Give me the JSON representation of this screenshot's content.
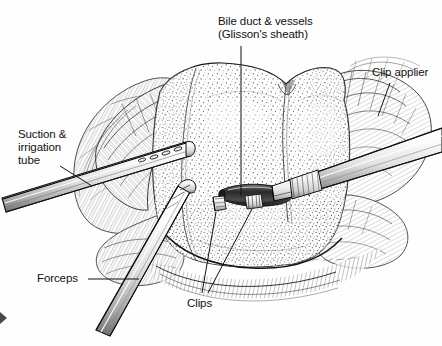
{
  "figure": {
    "background_color": "#fefefe",
    "ink_color": "#111111",
    "line_color": "#1a1a1a",
    "stipple_color": "#2b2b2b",
    "width": 442,
    "height": 346
  },
  "labels": {
    "bile_duct_line1": "Bile duct & vessels",
    "bile_duct_line2": "(Glisson's sheath)",
    "clip_applier": "Clip applier",
    "suction_line1": "Suction &",
    "suction_line2": "irrigation",
    "suction_line3": "tube",
    "forceps": "Forceps",
    "clips": "Clips"
  },
  "anatomy": {
    "organ_name": "liver parenchyma",
    "surrounding_tissue": "omental / fatty tissue",
    "duct_structure": "Glisson's sheath (bile duct & vessels)",
    "clip_count": 2
  },
  "instruments": [
    {
      "name": "suction-irrigation-tube",
      "entry_side": "left"
    },
    {
      "name": "clip-applier",
      "entry_side": "upper-right"
    },
    {
      "name": "forceps",
      "entry_side": "lower-left"
    }
  ]
}
